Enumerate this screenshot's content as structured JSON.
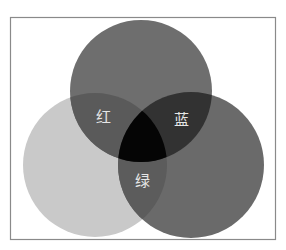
{
  "diagram": {
    "type": "venn",
    "frame": {
      "x": 10,
      "y": 17,
      "width": 265,
      "height": 222,
      "border_color": "#8a8a8a",
      "background": "#ffffff"
    },
    "sets": [
      {
        "id": "top",
        "cx": 141,
        "cy": 91,
        "r": 71,
        "fill": "#6e6e6e"
      },
      {
        "id": "left",
        "cx": 95,
        "cy": 165,
        "r": 72,
        "fill": "#c9c9c9"
      },
      {
        "id": "right",
        "cx": 191,
        "cy": 165,
        "r": 73,
        "fill": "#6a6a6a"
      }
    ],
    "overlap_colors": {
      "top_left": "#5a5a5a",
      "top_right": "#323232",
      "left_right": "#5c5c5c",
      "all_three": "#050505"
    },
    "labels": [
      {
        "id": "top_left",
        "text": "红",
        "x": 103,
        "y": 117
      },
      {
        "id": "top_right",
        "text": "蓝",
        "x": 181,
        "y": 120
      },
      {
        "id": "left_right",
        "text": "绿",
        "x": 142,
        "y": 181
      }
    ]
  }
}
